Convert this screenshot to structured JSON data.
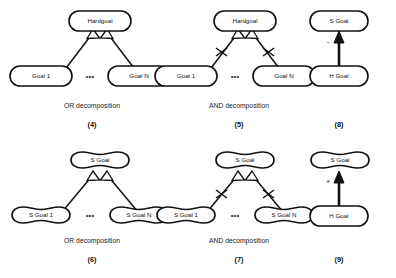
{
  "figure": {
    "background_color": "#ffffff",
    "line_color": "#111111",
    "text_color": "#111111",
    "ellipsis": "•••"
  },
  "panels": [
    {
      "id": "panel-4",
      "number": "(4)",
      "caption": "OR decomposition",
      "kind": "or-decomposition",
      "node_shape": "hardgoal-stadium",
      "parent": "Hardgoal",
      "children": [
        "Goal 1",
        "Goal N"
      ],
      "arrowhead": "hollow-triangle",
      "has_tick_marks": false
    },
    {
      "id": "panel-5",
      "number": "(5)",
      "caption": "AND decomposition",
      "kind": "and-decomposition",
      "node_shape": "hardgoal-stadium",
      "parent": "Hardgoal",
      "children": [
        "Goal 1",
        "Goal N"
      ],
      "arrowhead": "hollow-triangle",
      "has_tick_marks": true
    },
    {
      "id": "panel-8",
      "number": "(8)",
      "caption": "",
      "kind": "contribution-link",
      "node_shape": "hardgoal-stadium",
      "parent": "S Goal",
      "children": [
        "H Goal"
      ],
      "arrowhead": "solid-triangle",
      "sign": "-",
      "has_tick_marks": false
    },
    {
      "id": "panel-6",
      "number": "(6)",
      "caption": "OR decomposition",
      "kind": "or-decomposition",
      "node_shape": "softgoal-cloud",
      "parent": "S Goal",
      "children": [
        "S Goal 1",
        "S Goal N"
      ],
      "arrowhead": "hollow-triangle",
      "has_tick_marks": false
    },
    {
      "id": "panel-7",
      "number": "(7)",
      "caption": "AND decomposition",
      "kind": "and-decomposition",
      "node_shape": "softgoal-cloud",
      "parent": "S Goal",
      "children": [
        "S Goal 1",
        "S Goal N"
      ],
      "arrowhead": "hollow-triangle",
      "has_tick_marks": true
    },
    {
      "id": "panel-9",
      "number": "(9)",
      "caption": "",
      "kind": "contribution-link",
      "node_shape": "softgoal-cloud-and-hardgoal",
      "parent": "S Goal",
      "children": [
        "H Goal"
      ],
      "arrowhead": "solid-triangle",
      "sign": "+",
      "has_tick_marks": false
    }
  ],
  "labels": {
    "hardgoal": "Hardgoal",
    "goal_1": "Goal 1",
    "goal_n": "Goal N",
    "s_goal": "S Goal",
    "s_goal_1": "S Goal 1",
    "s_goal_n": "S Goal N",
    "h_goal": "H Goal",
    "or_decomposition": "OR decomposition",
    "and_decomposition": "AND decomposition",
    "num_4": "(4)",
    "num_5": "(5)",
    "num_6": "(6)",
    "num_7": "(7)",
    "num_8": "(8)",
    "num_9": "(9)",
    "sign_minus": "-",
    "sign_plus": "+",
    "ellipsis": "•••"
  }
}
